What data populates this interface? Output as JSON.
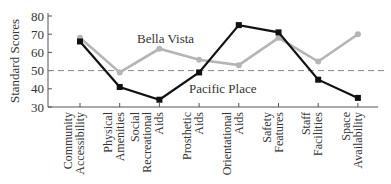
{
  "chart_data": {
    "type": "line",
    "title": "",
    "xlabel": "",
    "ylabel": "Standard Scores",
    "ylim": [
      30,
      80
    ],
    "yticks": [
      30,
      40,
      50,
      60,
      70,
      80
    ],
    "grid": false,
    "reference_line": {
      "value": 50,
      "style": "dashed"
    },
    "categories": [
      [
        "Community",
        "Accessibility"
      ],
      [
        "Physical",
        "Amenities"
      ],
      [
        "Social",
        "Recreational",
        "Aids"
      ],
      [
        "Prosthetic",
        "Aids"
      ],
      [
        "Orientational",
        "Aids"
      ],
      [
        "Safety",
        "Features"
      ],
      [
        "Staff",
        "Facilities"
      ],
      [
        "Space",
        "Availability"
      ]
    ],
    "series": [
      {
        "name": "Bella Vista",
        "color": "#b5b5b5",
        "values": [
          68,
          49,
          62,
          56,
          53,
          68,
          55,
          70
        ]
      },
      {
        "name": "Pacific Place",
        "color": "#111111",
        "values": [
          66,
          41,
          34,
          49,
          75,
          71,
          45,
          35
        ]
      }
    ],
    "annotations": [
      {
        "text": "Bella Vista",
        "series": 0
      },
      {
        "text": "Pacific Place",
        "series": 1
      }
    ]
  }
}
